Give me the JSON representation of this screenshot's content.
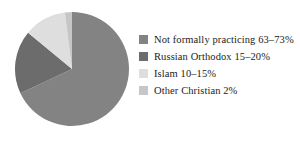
{
  "chart_data": {
    "type": "pie",
    "title": "",
    "subtitle": "",
    "xlabel": "",
    "ylabel": "",
    "legend_position": "right",
    "grid": false,
    "start_angle_deg": 90,
    "direction": "clockwise",
    "categories": [
      "Not formally practicing 63–73%",
      "Russian Orthodox 15–20%",
      "Islam 10–15%",
      "Other Christian 2%"
    ],
    "values": [
      68,
      18,
      12,
      2
    ],
    "colors": [
      "#838383",
      "#6c6c6c",
      "#dedede",
      "#c6c6c6"
    ],
    "slices": [
      {
        "label": "Not formally practicing 63–73%",
        "name": "Not formally practicing",
        "value_text": "63–73%",
        "value": 68,
        "color": "#838383"
      },
      {
        "label": "Russian Orthodox 15–20%",
        "name": "Russian Orthodox",
        "value_text": "15–20%",
        "value": 18,
        "color": "#6c6c6c"
      },
      {
        "label": "Islam 10–15%",
        "name": "Islam",
        "value_text": "10–15%",
        "value": 12,
        "color": "#dedede"
      },
      {
        "label": "Other Christian 2%",
        "name": "Other Christian",
        "value_text": "2%",
        "value": 2,
        "color": "#c6c6c6"
      }
    ]
  },
  "legend": {
    "items": [
      {
        "label": "Not formally practicing 63–73%",
        "swatch_name": "legend-swatch-not-formally-practicing"
      },
      {
        "label": "Russian Orthodox 15–20%",
        "swatch_name": "legend-swatch-russian-orthodox"
      },
      {
        "label": "Islam 10–15%",
        "swatch_name": "legend-swatch-islam"
      },
      {
        "label": "Other Christian 2%",
        "swatch_name": "legend-swatch-other-christian"
      }
    ]
  }
}
